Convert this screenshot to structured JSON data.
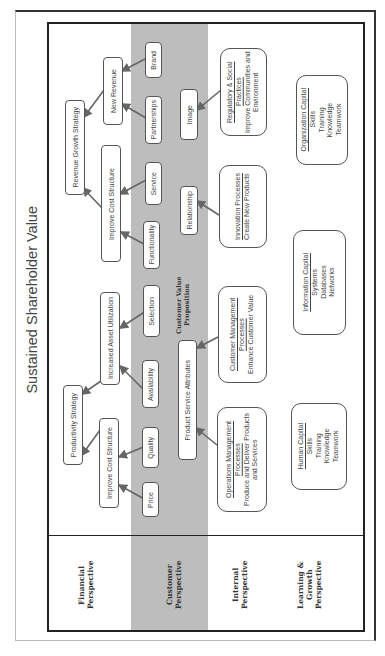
{
  "title": "Sustained Shareholder Value",
  "perspectives": [
    {
      "id": "financial",
      "label": "Financial Perspective"
    },
    {
      "id": "customer",
      "label": "Customer Perspective"
    },
    {
      "id": "internal",
      "label": "Internal Perspective"
    },
    {
      "id": "learning",
      "label": "Learning & Growth Perspective"
    }
  ],
  "financial": {
    "revenue_growth_strategy": "Revenue Growth Strategy",
    "productivity_strategy": "Productivity Strategy",
    "new_revenue": "New Revenue",
    "improve_cost_structure_top": "Improve Cost Structure",
    "increased_asset_utilization": "Increased Asset Utilization",
    "improve_cost_structure_bottom": "Improve Cost Structure"
  },
  "customer": {
    "value_proposition_label": "Customer Value Proposition",
    "attributes": [
      "Brand",
      "Partnerships",
      "Service",
      "Functionality",
      "Selection",
      "Availability",
      "Quality",
      "Price"
    ],
    "groups": [
      "Image",
      "Relationship",
      "Product Service Attributes"
    ]
  },
  "internal": {
    "regulatory": {
      "title": "Regulatory & Social Practices",
      "desc": "Improve Communities and Environment"
    },
    "innovation": {
      "title": "Innovation Processes",
      "desc": "Create New Products"
    },
    "customer_management": {
      "title": "Customer Management Processes",
      "desc": "Enhance Customer Value"
    },
    "operations": {
      "title": "Operations Management Processes",
      "desc": "Produce and Deliver Products and Services"
    }
  },
  "learning": {
    "organization": {
      "title": "Organization Capital",
      "items": [
        "Skills",
        "Training",
        "Knowledge",
        "Teamwork"
      ]
    },
    "information": {
      "title": "Information Capital",
      "items": [
        "Systems",
        "Databases",
        "Networks"
      ]
    },
    "human": {
      "title": "Human Capital",
      "items": [
        "Skills",
        "Training",
        "Knowledge",
        "Teamwork"
      ]
    }
  },
  "colors": {
    "band": "#bdbdbd",
    "arrow": "#666666",
    "border": "#222222"
  }
}
